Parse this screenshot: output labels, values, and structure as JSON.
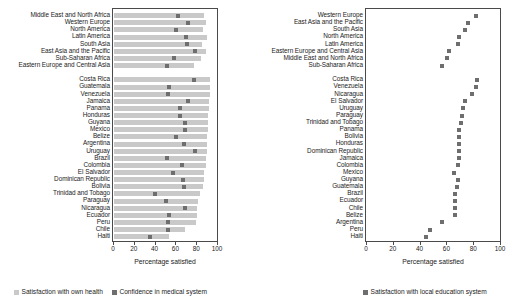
{
  "colors": {
    "bar_health": "#c9c9c9",
    "marker_medical": "#6e6e6e",
    "marker_education": "#6e6e6e",
    "axis": "#4a4a4a",
    "text": "#1b1b1b"
  },
  "left_panel": {
    "xlabel": "Percentage satisfied",
    "ticks": [
      "0",
      "20",
      "40",
      "60",
      "80",
      "100"
    ],
    "legend": [
      {
        "label": "Satisfaction with own health",
        "color": "#c9c9c9",
        "marker": "square"
      },
      {
        "label": "Confidence in medical system",
        "color": "#6e6e6e",
        "marker": "square"
      }
    ]
  },
  "right_panel": {
    "xlabel": "Percentage satisfied",
    "ticks": [
      "0",
      "20",
      "40",
      "60",
      "80",
      "100"
    ],
    "legend": [
      {
        "label": "Satisfaction with local education system",
        "color": "#6e6e6e",
        "marker": "square"
      }
    ]
  },
  "chart_data": [
    {
      "id": "health-and-medical",
      "type": "bar",
      "title": "",
      "xlabel": "Percentage satisfied",
      "ylabel": "",
      "xlim": [
        0,
        100
      ],
      "grid": false,
      "legend_position": "bottom",
      "series": [
        {
          "name": "Satisfaction with own health",
          "render": "bar",
          "color": "#c9c9c9"
        },
        {
          "name": "Confidence in medical system",
          "render": "marker",
          "color": "#6e6e6e"
        }
      ],
      "groups": [
        {
          "name": "regions",
          "categories": [
            "Middle East and North Africa",
            "Western Europe",
            "North America",
            "Latin America",
            "South Asia",
            "East Asia and the Pacific",
            "Sub-Saharan Africa",
            "Eastern Europe and Central Asia"
          ],
          "own_health": [
            87,
            88,
            86,
            89,
            85,
            88,
            84,
            77
          ],
          "medical_confidence": [
            62,
            71,
            60,
            69,
            70,
            78,
            58,
            51
          ]
        },
        {
          "name": "countries",
          "categories": [
            "Costa Rica",
            "Guatemala",
            "Venezuela",
            "Jamaica",
            "Panama",
            "Honduras",
            "Guyana",
            "Mexico",
            "Belize",
            "Argentina",
            "Uruguay",
            "Brazil",
            "Colombia",
            "El Salvador",
            "Dominican Republic",
            "Bolivia",
            "Trinidad and Tobago",
            "Paraguay",
            "Nicaragua",
            "Ecuador",
            "Peru",
            "Chile",
            "Haiti"
          ],
          "own_health": [
            92,
            92,
            92,
            91,
            91,
            90,
            90,
            90,
            89,
            89,
            89,
            88,
            88,
            87,
            87,
            86,
            83,
            81,
            80,
            80,
            79,
            68,
            53
          ],
          "medical_confidence": [
            77,
            53,
            52,
            71,
            63,
            63,
            68,
            68,
            60,
            67,
            78,
            51,
            65,
            57,
            66,
            67,
            39,
            50,
            68,
            53,
            52,
            52,
            35
          ]
        }
      ]
    },
    {
      "id": "education",
      "type": "scatter",
      "title": "",
      "xlabel": "Percentage satisfied",
      "ylabel": "",
      "xlim": [
        0,
        100
      ],
      "grid": false,
      "legend_position": "bottom",
      "series": [
        {
          "name": "Satisfaction with local education system",
          "render": "marker",
          "color": "#6e6e6e"
        }
      ],
      "groups": [
        {
          "name": "regions",
          "categories": [
            "Western Europe",
            "East Asia and the Pacific",
            "South Asia",
            "North America",
            "Latin America",
            "Eastern Europe and Central Asia",
            "Middle East and North Africa",
            "Sub-Saharan Africa"
          ],
          "education_satisfaction": [
            81,
            75,
            73,
            69,
            68,
            61,
            60,
            56
          ]
        },
        {
          "name": "countries",
          "categories": [
            "Costa Rica",
            "Venezuela",
            "Nicaragua",
            "El Salvador",
            "Uruguay",
            "Paraguay",
            "Trinidad and Tobago",
            "Panama",
            "Bolivia",
            "Honduras",
            "Dominican Republic",
            "Jamaica",
            "Colombia",
            "Mexico",
            "Guyana",
            "Guatemala",
            "Brazil",
            "Ecuador",
            "Chile",
            "Belize",
            "Argentina",
            "Peru",
            "Haiti"
          ],
          "education_satisfaction": [
            82,
            81,
            78,
            73,
            72,
            71,
            70,
            69,
            69,
            69,
            69,
            69,
            68,
            65,
            68,
            67,
            66,
            66,
            66,
            66,
            56,
            47,
            44
          ]
        }
      ]
    }
  ]
}
